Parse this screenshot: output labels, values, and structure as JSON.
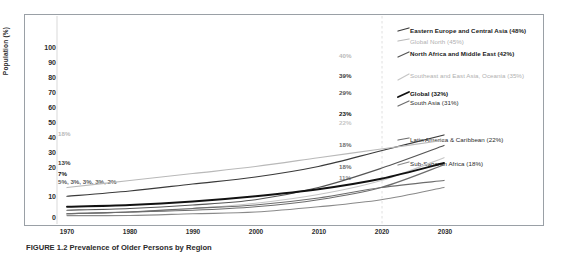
{
  "figure": {
    "caption": "FIGURE 1.2  Prevalence of Older Persons by Region"
  },
  "chart_data": {
    "type": "line",
    "title": "",
    "xlabel": "",
    "ylabel": "Population (%)",
    "xlim": [
      1970,
      2030
    ],
    "ylim": [
      0,
      105
    ],
    "xticks": [
      "1970",
      "1980",
      "1990",
      "2000",
      "2010",
      "2020",
      "2030"
    ],
    "yticks": [
      "0",
      "10",
      "20",
      "30",
      "40",
      "50",
      "60",
      "70",
      "80",
      "90",
      "100"
    ],
    "grid": "vertical-dashed-at-2020",
    "legend_position": "right-inline",
    "x": [
      1970,
      1980,
      1990,
      2000,
      2010,
      2020,
      2030
    ],
    "series": [
      {
        "name": "Eastern Europe and Central Asia",
        "label": "Eastern Europe and Central Asia (48%)",
        "end_value": 48,
        "start_label": "13%",
        "value_2020": "39%",
        "color": "#3a3a3a",
        "emphasis": "dark",
        "values": [
          13,
          16,
          20,
          24,
          30,
          39,
          48
        ]
      },
      {
        "name": "Global North",
        "label": "Global North (45%)",
        "end_value": 45,
        "start_label": "18%",
        "value_2020": "40%",
        "color": "#b9b9b9",
        "emphasis": "light",
        "values": [
          18,
          22,
          26,
          30,
          35,
          40,
          45
        ]
      },
      {
        "name": "North Africa and Middle East",
        "label": "North Africa and Middle East (42%)",
        "end_value": 42,
        "start_label": "5%",
        "value_2020": "29%",
        "color": "#555555",
        "emphasis": "dark",
        "values": [
          5,
          6,
          8,
          11,
          18,
          29,
          42
        ]
      },
      {
        "name": "Southeast and East Asia, Oceania",
        "label": "Southeast and East Asia, Oceania (35%)",
        "end_value": 35,
        "start_label": "3%",
        "value_2020": "22%",
        "color": "#c6c6c6",
        "emphasis": "light",
        "values": [
          3,
          4,
          6,
          9,
          14,
          22,
          35
        ]
      },
      {
        "name": "Global",
        "label": "Global (32%)",
        "end_value": 32,
        "start_label": "7%",
        "value_2020": "23%",
        "color": "#111111",
        "emphasis": "bold",
        "values": [
          7,
          8,
          10,
          13,
          17,
          23,
          32
        ]
      },
      {
        "name": "South Asia",
        "label": "South Asia (31%)",
        "end_value": 31,
        "start_label": "3%",
        "value_2020": "18%",
        "color": "#6d6d6d",
        "emphasis": "dark",
        "values": [
          3,
          4,
          5,
          7,
          11,
          18,
          31
        ]
      },
      {
        "name": "Latin America & Caribbean",
        "label": "Latin America & Caribbean (22%)",
        "end_value": 22,
        "start_label": "3%",
        "value_2020": "18%",
        "color": "#6d6d6d",
        "emphasis": "mid",
        "values": [
          3,
          4,
          6,
          8,
          12,
          18,
          22
        ]
      },
      {
        "name": "Sub-Saharan Africa",
        "label": "Sub-Saharan Africa (18%)",
        "end_value": 18,
        "start_label": "2%",
        "value_2020": "11%",
        "color": "#8a8a8a",
        "emphasis": "mid",
        "values": [
          2,
          2,
          3,
          4,
          7,
          11,
          18
        ]
      }
    ],
    "start_label_row": "5%, 3%, 3%, 3%, 2%",
    "value_labels_2020": [
      "40%",
      "39%",
      "29%",
      "23%",
      "22%",
      "18%",
      "18%",
      "11%"
    ]
  }
}
